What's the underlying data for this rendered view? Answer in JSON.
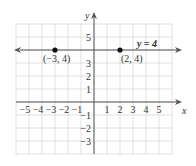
{
  "chart_data": {
    "type": "line",
    "title": "",
    "xlabel": "x",
    "ylabel": "y",
    "xlim": [
      -6,
      6
    ],
    "ylim": [
      -4,
      6
    ],
    "grid": true,
    "x_ticks": [
      "−5",
      "−4",
      "−3",
      "−2",
      "−1",
      "1",
      "2",
      "3",
      "4",
      "5"
    ],
    "y_ticks": [
      "5",
      "3",
      "2",
      "1",
      "−1",
      "−2",
      "−3"
    ],
    "series": [
      {
        "name": "y = 4",
        "x": [
          -6,
          6
        ],
        "y": [
          4,
          4
        ]
      }
    ],
    "points": [
      {
        "x": -3,
        "y": 4,
        "label": "(−3, 4)"
      },
      {
        "x": 2,
        "y": 4,
        "label": "(2, 4)"
      }
    ],
    "annotations": [
      "y = 4"
    ]
  }
}
